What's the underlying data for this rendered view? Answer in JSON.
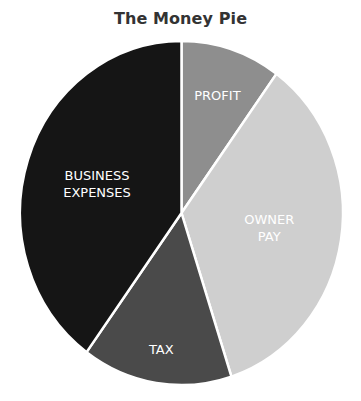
{
  "chart_data": {
    "type": "pie",
    "title": "The Money Pie",
    "start_angle": "top (12 o'clock)",
    "direction": "clockwise",
    "legend": "none (labels on slices)",
    "slices": [
      {
        "label": "PROFIT",
        "label_lines": [
          "PROFIT"
        ],
        "value": 10,
        "color": "#8e8e8e"
      },
      {
        "label": "OWNER PAY",
        "label_lines": [
          "OWNER",
          "PAY"
        ],
        "value": 35,
        "color": "#cfcfcf"
      },
      {
        "label": "TAX",
        "label_lines": [
          "TAX"
        ],
        "value": 15,
        "color": "#4a4a4a"
      },
      {
        "label": "BUSINESS EXPENSES",
        "label_lines": [
          "BUSINESS",
          "EXPENSES"
        ],
        "value": 40,
        "color": "#151515"
      }
    ],
    "categories": [
      "PROFIT",
      "OWNER PAY",
      "TAX",
      "BUSINESS EXPENSES"
    ],
    "values": [
      10,
      35,
      15,
      40
    ],
    "units": "percent (estimated from slice angles)"
  }
}
